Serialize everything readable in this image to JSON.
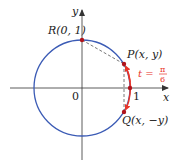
{
  "diagram": {
    "colors": {
      "circle": "#3b5bb5",
      "arc": "#e8352a",
      "axis": "#333333",
      "point": "#b0141c",
      "dash": "#555555"
    },
    "axes": {
      "x_label": "x",
      "y_label": "y",
      "origin_label": "0",
      "tick_one_label": "1"
    },
    "points": {
      "R": {
        "label": "R(0, 1)"
      },
      "P": {
        "label": "P(x, y)"
      },
      "Q": {
        "label": "Q(x, −y)"
      }
    },
    "arc_label": {
      "t": "t =",
      "num": "π",
      "den": "6"
    }
  }
}
